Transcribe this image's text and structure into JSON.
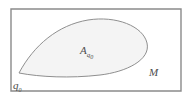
{
  "figure": {
    "background_color": "#ffffff",
    "outer_rectangle": {
      "name": "manifold-boundary",
      "stroke_color": "#8a8a8a",
      "fill_color": "#ffffff",
      "x": 11,
      "y": 9,
      "width": 170,
      "height": 82,
      "stroke_width": 1.4
    },
    "region": {
      "name": "leaf-region",
      "stroke_color": "#8f8f8f",
      "fill_color": "#f4f4f4",
      "stroke_width": 1.0,
      "cusp_point": {
        "x": 19,
        "y": 73
      },
      "path": "M 19,73 C 34,45 58,25 88,20 C 116,15.5 143,26 147,43 C 151,60 126,72 100,75 C 70,78.5 40,77 19,73 Z"
    },
    "labels": {
      "region_label": {
        "name": "region-label",
        "base": "A",
        "subscript_letter": "q",
        "subscript_number": "0",
        "x": 80,
        "y": 54,
        "color": "#4d4d4d"
      },
      "cusp_label": {
        "name": "cusp-point-label",
        "base": "q",
        "subscript_number": "0",
        "x": 13,
        "y": 89,
        "color": "#4d4d4d"
      },
      "manifold_label": {
        "name": "manifold-label",
        "base": "M",
        "x": 149,
        "y": 76,
        "color": "#4d4d4d"
      }
    }
  }
}
